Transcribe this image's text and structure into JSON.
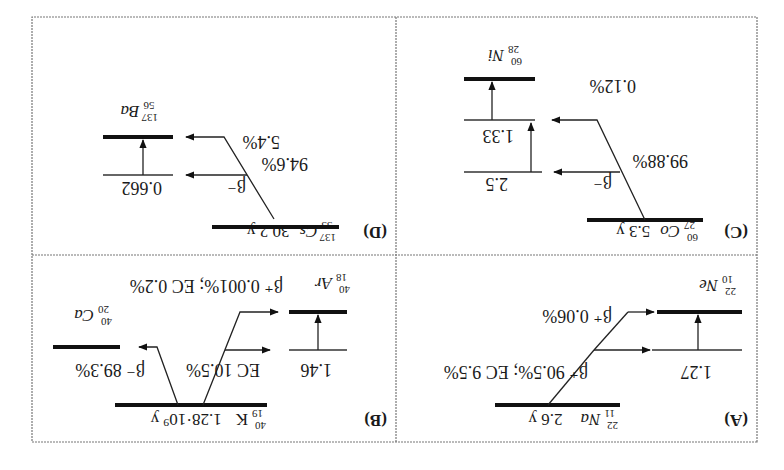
{
  "figure": {
    "orientation": "rotated 180 degrees",
    "panels": [
      {
        "id": "A",
        "label": "(A)",
        "parent": {
          "mass": "22",
          "atomic": "11",
          "symbol": "Na",
          "half_life": "2.6 y"
        },
        "daughter": {
          "mass": "22",
          "atomic": "10",
          "symbol": "Ne"
        },
        "excited_level": "1.27",
        "branches": [
          "β⁺ 90.5%; EC 9.5%",
          "β⁺ 0.06%"
        ]
      },
      {
        "id": "B",
        "label": "(B)",
        "parent": {
          "mass": "40",
          "atomic": "19",
          "symbol": "K",
          "half_life": "1.28·10⁹ y"
        },
        "daughters": [
          {
            "mass": "40",
            "atomic": "20",
            "symbol": "Ca"
          },
          {
            "mass": "40",
            "atomic": "18",
            "symbol": "Ar"
          }
        ],
        "excited_level": "1.46",
        "branches": [
          "β⁻ 89.3%",
          "EC 10.5%",
          "β⁺ 0.001%; EC 0.2%"
        ]
      },
      {
        "id": "C",
        "label": "(C)",
        "parent": {
          "mass": "60",
          "atomic": "27",
          "symbol": "Co",
          "half_life": "5.3 y"
        },
        "daughter": {
          "mass": "60",
          "atomic": "28",
          "symbol": "Ni"
        },
        "levels": [
          "2.5",
          "1.33"
        ],
        "branches": [
          "β⁻",
          "99.88%",
          "0.12%"
        ]
      },
      {
        "id": "D",
        "label": "(D)",
        "parent": {
          "mass": "137",
          "atomic": "55",
          "symbol": "Cs",
          "half_life": "30.2 y"
        },
        "daughter": {
          "mass": "137",
          "atomic": "56",
          "symbol": "Ba"
        },
        "excited_level": "0.662",
        "branches": [
          "β⁻",
          "94.6%",
          "5.4%"
        ]
      }
    ]
  }
}
